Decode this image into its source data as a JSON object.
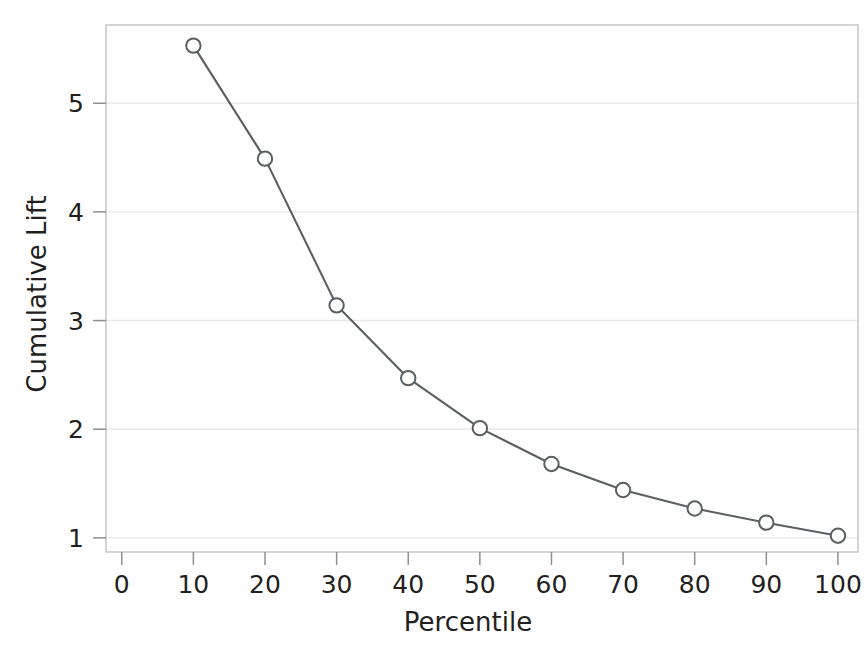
{
  "chart_data": {
    "type": "line",
    "title": "",
    "subtitle": "",
    "xlabel": "Percentile",
    "ylabel": "Cumulative Lift",
    "x": [
      10,
      20,
      30,
      40,
      50,
      60,
      70,
      80,
      90,
      100
    ],
    "values": [
      5.53,
      4.49,
      3.14,
      2.47,
      2.01,
      1.68,
      1.44,
      1.27,
      1.14,
      1.02
    ],
    "series": [
      {
        "name": "Cumulative Lift",
        "values": [
          5.53,
          4.49,
          3.14,
          2.47,
          2.01,
          1.68,
          1.44,
          1.27,
          1.14,
          1.02
        ]
      }
    ],
    "xlim": [
      -2.2,
      102.8
    ],
    "ylim": [
      0.87,
      5.72
    ],
    "xticks": [
      0,
      10,
      20,
      30,
      40,
      50,
      60,
      70,
      80,
      90,
      100
    ],
    "xtick_labels": [
      "0",
      "10",
      "20",
      "30",
      "40",
      "50",
      "60",
      "70",
      "80",
      "90",
      "100"
    ],
    "yticks": [
      1,
      2,
      3,
      4,
      5
    ],
    "ytick_labels": [
      "1",
      "2",
      "3",
      "4",
      "5"
    ],
    "grid": true,
    "grid_axis": "y",
    "legend": false,
    "legend_position": "none",
    "marker": "open-circle",
    "line_color": "#5a5f63",
    "marker_color": "#5a5f63",
    "marker_fill": "#ffffff",
    "grid_color": "#e9e9ea",
    "frame_color": "#c9cace",
    "background_color": "#ffffff",
    "text_color": "#231f20"
  }
}
